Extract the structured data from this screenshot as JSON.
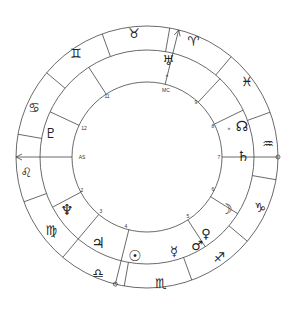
{
  "chart": {
    "center": [
      147,
      157
    ],
    "radii": {
      "outer": 131,
      "zodiac_inner": 107,
      "house": 75
    },
    "line_color": "#444444",
    "glyph_color": "#222222"
  },
  "zodiac": {
    "first_divider_angle": 80,
    "signs": [
      {
        "name": "aries",
        "glyph": "♈"
      },
      {
        "name": "taurus",
        "glyph": "♉"
      },
      {
        "name": "gemini",
        "glyph": "♊"
      },
      {
        "name": "cancer",
        "glyph": "♋"
      },
      {
        "name": "leo",
        "glyph": "♌"
      },
      {
        "name": "virgo",
        "glyph": "♍"
      },
      {
        "name": "libra",
        "glyph": "♎"
      },
      {
        "name": "scorpio",
        "glyph": "♏"
      },
      {
        "name": "sagittarius",
        "glyph": "♐"
      },
      {
        "name": "capricorn",
        "glyph": "♑"
      },
      {
        "name": "aquarius",
        "glyph": "♒"
      },
      {
        "name": "pisces",
        "glyph": "♓"
      }
    ],
    "sign_positions": [
      {
        "sign": "aries",
        "x": 193,
        "y": 41
      },
      {
        "sign": "taurus",
        "x": 134,
        "y": 33
      },
      {
        "sign": "gemini",
        "x": 76,
        "y": 53
      },
      {
        "sign": "cancer",
        "x": 34,
        "y": 107
      },
      {
        "sign": "leo",
        "x": 26,
        "y": 172
      },
      {
        "sign": "virgo",
        "x": 51,
        "y": 230
      },
      {
        "sign": "libra",
        "x": 98,
        "y": 273
      },
      {
        "sign": "scorpio",
        "x": 161,
        "y": 283
      },
      {
        "sign": "sagittarius",
        "x": 219,
        "y": 257
      },
      {
        "sign": "capricorn",
        "x": 260,
        "y": 207
      },
      {
        "sign": "aquarius",
        "x": 268,
        "y": 143
      },
      {
        "sign": "pisces",
        "x": 247,
        "y": 81
      }
    ]
  },
  "houses": {
    "cusp_angles": [
      180,
      155,
      123,
      76,
      47,
      26,
      0,
      328,
      303,
      256,
      230,
      208
    ],
    "labels": [
      {
        "text": "AS",
        "x": 82,
        "y": 157
      },
      {
        "text": "12",
        "x": 84,
        "y": 128
      },
      {
        "text": "11",
        "x": 107,
        "y": 96
      },
      {
        "text": "MC",
        "x": 166,
        "y": 90
      },
      {
        "text": "9",
        "x": 196,
        "y": 102
      },
      {
        "text": "8",
        "x": 213,
        "y": 126
      },
      {
        "text": "7",
        "x": 219,
        "y": 157
      },
      {
        "text": "6",
        "x": 213,
        "y": 189
      },
      {
        "text": "5",
        "x": 188,
        "y": 216
      },
      {
        "text": "4",
        "x": 126,
        "y": 226
      },
      {
        "text": "3",
        "x": 101,
        "y": 211
      },
      {
        "text": "2",
        "x": 82,
        "y": 190
      }
    ],
    "axes": [
      {
        "name": "ascendant-descendant",
        "angle": 180,
        "arrow_end": "AS"
      },
      {
        "name": "mc-ic",
        "angle": 76,
        "arrow_end": "MC"
      }
    ]
  },
  "planets": [
    {
      "name": "uranus",
      "glyph": "♅",
      "x": 168,
      "y": 60,
      "size": 13
    },
    {
      "name": "node",
      "glyph": "☊",
      "x": 242,
      "y": 126,
      "size": 14
    },
    {
      "name": "saturn",
      "glyph": "♄",
      "x": 243,
      "y": 156,
      "size": 14
    },
    {
      "name": "moon",
      "glyph": "☽",
      "x": 226,
      "y": 209,
      "size": 14
    },
    {
      "name": "mars",
      "glyph": "♂",
      "x": 197,
      "y": 245,
      "size": 13
    },
    {
      "name": "venus",
      "glyph": "♀",
      "x": 206,
      "y": 233,
      "size": 13
    },
    {
      "name": "mercury",
      "glyph": "☿",
      "x": 174,
      "y": 251,
      "size": 13
    },
    {
      "name": "sun",
      "glyph": "☉",
      "x": 135,
      "y": 256,
      "size": 15
    },
    {
      "name": "jupiter",
      "glyph": "♃",
      "x": 98,
      "y": 243,
      "size": 15
    },
    {
      "name": "neptune",
      "glyph": "♆",
      "x": 67,
      "y": 210,
      "size": 15
    },
    {
      "name": "pluto",
      "glyph": "♇",
      "x": 51,
      "y": 133,
      "size": 14
    }
  ],
  "markers": [
    {
      "name": "uranus-dot",
      "text": "»",
      "x": 167,
      "y": 75
    },
    {
      "name": "node-dot",
      "text": "»",
      "x": 229,
      "y": 128
    }
  ]
}
